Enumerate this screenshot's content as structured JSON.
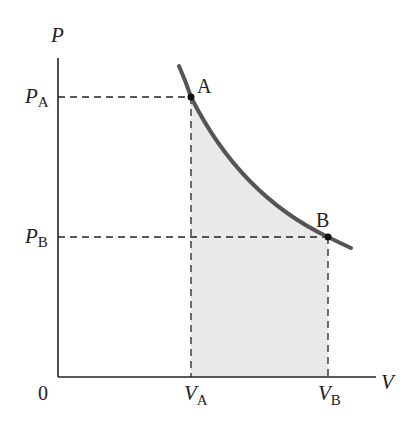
{
  "diagram": {
    "type": "PV-diagram",
    "axes": {
      "y_label": "P",
      "x_label": "V",
      "origin_label": "0"
    },
    "ticks": {
      "pa": {
        "main": "P",
        "sub": "A"
      },
      "pb": {
        "main": "P",
        "sub": "B"
      },
      "va": {
        "main": "V",
        "sub": "A"
      },
      "vb": {
        "main": "V",
        "sub": "B"
      }
    },
    "points": [
      {
        "label": "A",
        "x": 191,
        "y": 97
      },
      {
        "label": "B",
        "x": 328,
        "y": 237
      }
    ],
    "colors": {
      "curve": "#555555",
      "shade": "#e8e8e8",
      "axis": "#222222"
    }
  }
}
